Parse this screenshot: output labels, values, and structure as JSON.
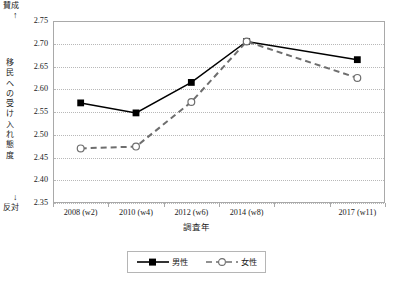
{
  "chart_data": {
    "type": "line",
    "title": "",
    "xlabel": "調査年",
    "ylabel": "移民への受け入れ態度",
    "ylabel_top_anchor": "賛成",
    "ylabel_bottom_anchor": "反対",
    "categories": [
      "2008 (w2)",
      "2010 (w4)",
      "2012 (w6)",
      "2014 (w8)",
      "2017 (w11)"
    ],
    "category_slots": [
      0,
      1,
      2,
      3,
      5
    ],
    "slot_count": 6,
    "ylim": [
      2.35,
      2.75
    ],
    "yticks": [
      "2.75",
      "2.70",
      "2.65",
      "2.60",
      "2.55",
      "2.50",
      "2.45",
      "2.40",
      "2.35"
    ],
    "ytick_values": [
      2.75,
      2.7,
      2.65,
      2.6,
      2.55,
      2.5,
      2.45,
      2.4,
      2.35
    ],
    "grid": true,
    "legend_position": "bottom-center",
    "series": [
      {
        "name": "男性",
        "marker": "filled-square",
        "line": "solid",
        "color": "#000000",
        "values": [
          2.57,
          2.548,
          2.615,
          2.705,
          2.665
        ]
      },
      {
        "name": "女性",
        "marker": "open-circle",
        "line": "dashed",
        "color": "#6e6e6e",
        "values": [
          2.47,
          2.474,
          2.572,
          2.705,
          2.625
        ]
      }
    ]
  },
  "legend": {
    "items": [
      {
        "label": "男性"
      },
      {
        "label": "女性"
      }
    ]
  }
}
